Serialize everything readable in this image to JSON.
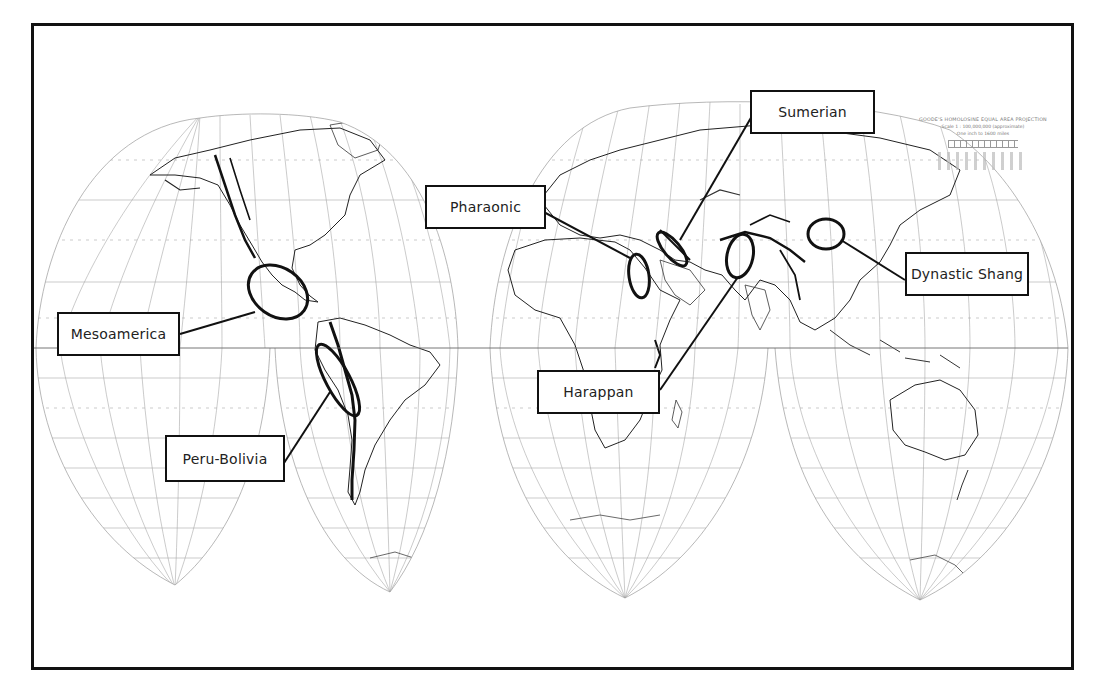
{
  "map": {
    "projection_legend": {
      "title": "GOODE'S HOMOLOSINE EQUAL AREA PROJECTION",
      "scale": "Scale 1 : 100,000,000 (approximate)",
      "inch": "One inch to 1600 miles"
    },
    "colors": {
      "frame": "#111111",
      "ink": "#111111",
      "graticule": "#9a9a9a",
      "background": "#ffffff"
    },
    "labels": [
      {
        "id": "sumerian",
        "text": "Sumerian"
      },
      {
        "id": "pharaonic",
        "text": "Pharaonic"
      },
      {
        "id": "dynastic-shang",
        "text": "Dynastic Shang"
      },
      {
        "id": "mesoamerica",
        "text": "Mesoamerica"
      },
      {
        "id": "harappan",
        "text": "Harappan"
      },
      {
        "id": "peru-bolivia",
        "text": "Peru-Bolivia"
      }
    ]
  }
}
